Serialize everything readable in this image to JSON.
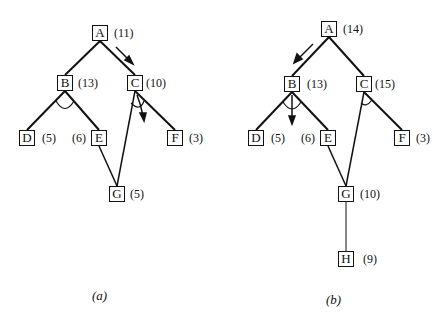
{
  "diagrams": [
    {
      "caption": "(a)",
      "nodes": {
        "A": {
          "label": "A",
          "cost": "(11)"
        },
        "B": {
          "label": "B",
          "cost": "(13)"
        },
        "C": {
          "label": "C",
          "cost": "(10)"
        },
        "D": {
          "label": "D",
          "cost": "(5)"
        },
        "E": {
          "label": "E",
          "cost": "(6)"
        },
        "F": {
          "label": "F",
          "cost": "(3)"
        },
        "G": {
          "label": "G",
          "cost": "(5)"
        }
      },
      "edges": [
        [
          "A",
          "B"
        ],
        [
          "A",
          "C"
        ],
        [
          "B",
          "D"
        ],
        [
          "B",
          "E"
        ],
        [
          "C",
          "F"
        ],
        [
          "C",
          "G"
        ],
        [
          "E",
          "G"
        ]
      ],
      "and_arcs": [
        {
          "at": "B",
          "children": [
            "D",
            "E"
          ]
        },
        {
          "at": "C",
          "children": [
            "G",
            "F"
          ]
        }
      ],
      "arrows": [
        {
          "along": "A-C",
          "direction": "down"
        },
        {
          "from": "C",
          "direction": "down"
        }
      ]
    },
    {
      "caption": "(b)",
      "nodes": {
        "A": {
          "label": "A",
          "cost": "(14)"
        },
        "B": {
          "label": "B",
          "cost": "(13)"
        },
        "C": {
          "label": "C",
          "cost": "(15)"
        },
        "D": {
          "label": "D",
          "cost": "(5)"
        },
        "E": {
          "label": "E",
          "cost": "(6)"
        },
        "F": {
          "label": "F",
          "cost": "(3)"
        },
        "G": {
          "label": "G",
          "cost": "(10)"
        },
        "H": {
          "label": "H",
          "cost": "(9)"
        }
      },
      "edges": [
        [
          "A",
          "B"
        ],
        [
          "A",
          "C"
        ],
        [
          "B",
          "D"
        ],
        [
          "B",
          "E"
        ],
        [
          "C",
          "F"
        ],
        [
          "C",
          "G"
        ],
        [
          "E",
          "G"
        ],
        [
          "G",
          "H"
        ]
      ],
      "and_arcs": [
        {
          "at": "B",
          "children": [
            "D",
            "E"
          ]
        },
        {
          "at": "C",
          "children": [
            "G",
            "F"
          ]
        }
      ],
      "arrows": [
        {
          "along": "A-B",
          "direction": "down"
        },
        {
          "from": "B",
          "direction": "down"
        }
      ]
    }
  ]
}
